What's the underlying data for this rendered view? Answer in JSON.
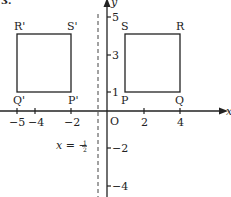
{
  "question_number": "3.",
  "axes": {
    "x_label": "x",
    "y_label": "y",
    "origin_label": "O",
    "x_ticks": [
      {
        "value": -5,
        "label": "−5",
        "px": 17
      },
      {
        "value": -4,
        "label": "−4",
        "px": 35
      },
      {
        "value": -2,
        "label": "−2",
        "px": 71
      },
      {
        "value": 2,
        "label": "2",
        "px": 144
      },
      {
        "value": 4,
        "label": "4",
        "px": 180
      }
    ],
    "y_ticks": [
      {
        "value": 5,
        "label": "5",
        "px": 17
      },
      {
        "value": 3,
        "label": "3",
        "px": 55
      },
      {
        "value": 1,
        "label": "1",
        "px": 92
      },
      {
        "value": -2,
        "label": "−2",
        "px": 148
      },
      {
        "value": -4,
        "label": "−4",
        "px": 186
      }
    ]
  },
  "mirror_line": {
    "equation_prefix": "x = −",
    "fraction_num": "1",
    "fraction_den": "2",
    "x_value": -0.5
  },
  "shapes": {
    "original": {
      "name": "PQRS",
      "vertices": {
        "P": [
          1,
          1
        ],
        "Q": [
          4,
          1
        ],
        "R": [
          4,
          4
        ],
        "S": [
          1,
          4
        ]
      },
      "labels": {
        "P": "P",
        "Q": "Q",
        "R": "R",
        "S": "S"
      }
    },
    "image": {
      "name": "P'Q'R'S'",
      "vertices": {
        "P'": [
          -2,
          1
        ],
        "Q'": [
          -5,
          1
        ],
        "R'": [
          -5,
          4
        ],
        "S'": [
          -2,
          4
        ]
      },
      "labels": {
        "P": "P'",
        "Q": "Q'",
        "R": "R'",
        "S": "S'"
      }
    }
  },
  "colors": {
    "stroke": "#222222",
    "background": "#ffffff"
  }
}
